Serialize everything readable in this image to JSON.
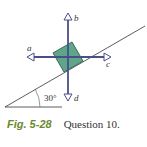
{
  "figure": {
    "angle_label": "30°",
    "vectors": [
      {
        "id": "a",
        "label": "a",
        "direction": "left"
      },
      {
        "id": "b",
        "label": "b",
        "direction": "up"
      },
      {
        "id": "c",
        "label": "c",
        "direction": "right"
      },
      {
        "id": "d",
        "label": "d",
        "direction": "down"
      }
    ],
    "colors": {
      "block": "#5fa58a",
      "arrows": "#4a4f8a",
      "lines": "#333333",
      "caption_accent": "#6a8a2e"
    }
  },
  "caption": {
    "fig_number": "Fig. 5-28",
    "text": "Question 10."
  }
}
